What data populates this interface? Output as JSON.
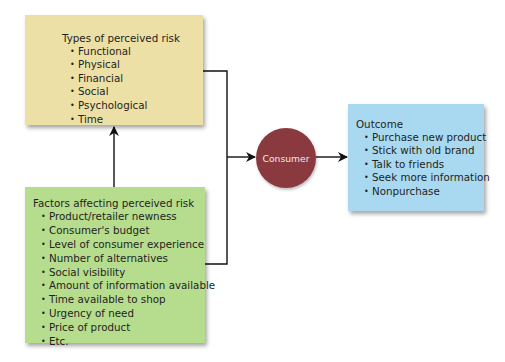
{
  "diagram": {
    "types_box": {
      "title": "Types of perceived risk",
      "items": [
        "Functional",
        "Physical",
        "Financial",
        "Social",
        "Psychological",
        "Time"
      ],
      "color": "#ece0a6"
    },
    "factors_box": {
      "title": "Factors affecting perceived risk",
      "items": [
        "Product/retailer newness",
        "Consumer's budget",
        "Level of consumer experience",
        "Number of alternatives",
        "Social visibility",
        "Amount of information available",
        "Time available to shop",
        "Urgency of need",
        "Price of product",
        "Etc."
      ],
      "color": "#b6dc8e"
    },
    "consumer_node": {
      "label": "Consumer",
      "color": "#8a3a3f"
    },
    "outcome_box": {
      "title": "Outcome",
      "items": [
        "Purchase new product",
        "Stick with old brand",
        "Talk to friends",
        "Seek more information",
        "Nonpurchase"
      ],
      "color": "#a9d8f1"
    },
    "edges": [
      {
        "from": "factors_box",
        "to": "types_box",
        "type": "arrow"
      },
      {
        "from": "types_box",
        "to": "consumer_node",
        "type": "bracket-arrow"
      },
      {
        "from": "factors_box",
        "to": "consumer_node",
        "type": "bracket-arrow"
      },
      {
        "from": "consumer_node",
        "to": "outcome_box",
        "type": "arrow"
      }
    ]
  }
}
